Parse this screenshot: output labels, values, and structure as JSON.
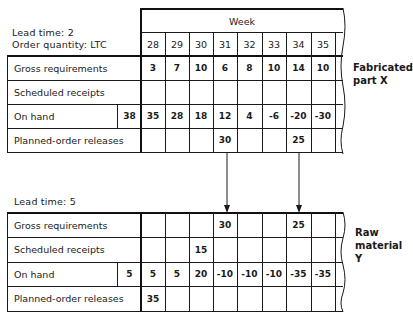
{
  "top": {
    "lead_time_label": "Lead time: 2",
    "order_quantity_label": "Order quantity: LTC",
    "week_label": "Week",
    "weeks": [
      "28",
      "29",
      "30",
      "31",
      "32",
      "33",
      "34",
      "35"
    ],
    "side_label": "Fabricated\npart X",
    "rows": [
      {
        "label": "Gross requirements",
        "initial": "",
        "values": [
          "3",
          "7",
          "10",
          "6",
          "8",
          "10",
          "14",
          "10"
        ]
      },
      {
        "label": "Scheduled receipts",
        "initial": "",
        "values": [
          "",
          "",
          "",
          "",
          "",
          "",
          "",
          ""
        ]
      },
      {
        "label": "On hand",
        "initial": "38",
        "values": [
          "35",
          "28",
          "18",
          "12",
          "4",
          "-6",
          "-20",
          "-30"
        ]
      },
      {
        "label": "Planned-order releases",
        "initial": "",
        "values": [
          "",
          "",
          "",
          "30",
          "",
          "",
          "25",
          ""
        ]
      }
    ]
  },
  "bottom": {
    "lead_time_label": "Lead time: 5",
    "side_label": "Raw\nmaterial Y",
    "rows": [
      {
        "label": "Gross requirements",
        "initial": "",
        "values": [
          "",
          "",
          "",
          "30",
          "",
          "",
          "25",
          ""
        ]
      },
      {
        "label": "Scheduled receipts",
        "initial": "",
        "values": [
          "",
          "",
          "15",
          "",
          "",
          "",
          "",
          ""
        ]
      },
      {
        "label": "On hand",
        "initial": "5",
        "values": [
          "5",
          "5",
          "20",
          "-10",
          "-10",
          "-10",
          "-35",
          "-35"
        ]
      },
      {
        "label": "Planned-order releases",
        "initial": "",
        "values": [
          "35",
          "",
          "",
          "",
          "",
          "",
          "",
          ""
        ]
      }
    ]
  },
  "arrows": [
    {
      "from_week": "31",
      "to_week": "31"
    },
    {
      "from_week": "34",
      "to_week": "34"
    }
  ]
}
